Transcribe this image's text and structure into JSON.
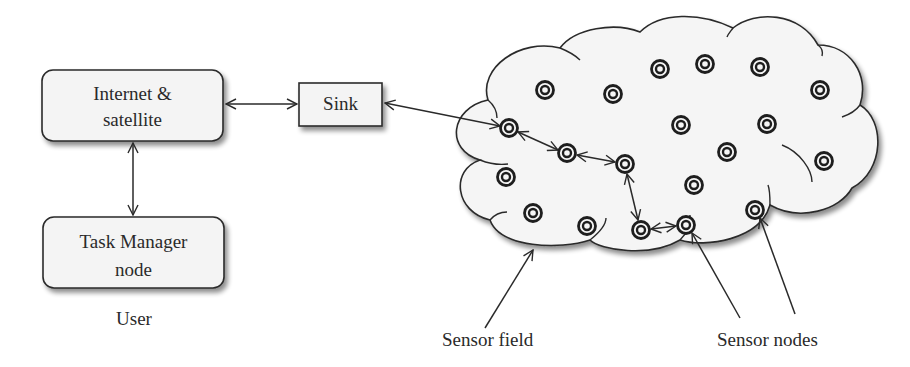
{
  "diagram": {
    "boxes": {
      "internet": {
        "line1": "Internet &",
        "line2": "satellite"
      },
      "task_manager": {
        "line1": "Task Manager",
        "line2": "node"
      },
      "sink": {
        "label": "Sink"
      }
    },
    "labels": {
      "user": "User",
      "sensor_field": "Sensor field",
      "sensor_nodes": "Sensor nodes"
    },
    "colors": {
      "stroke": "#2a2a2a",
      "box_fill": "#f4f4f4",
      "cloud_fill": "#f5f5f5",
      "shadow": "#9a9a9a"
    },
    "sensor_node_count": 20
  }
}
